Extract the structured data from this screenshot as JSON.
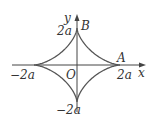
{
  "diagram": {
    "type": "astroid curve",
    "equation_hint": "x^(2/3) + y^(2/3) = (2a)^(2/3)",
    "axes": {
      "x_label": "x",
      "y_label": "y",
      "origin_label": "O"
    },
    "points": {
      "A": "A",
      "B": "B"
    },
    "ticks": {
      "x_pos": "2a",
      "x_neg": "−2a",
      "y_pos": "2a",
      "y_neg": "−2a"
    },
    "colors": {
      "curve": "#555555",
      "axis": "#333333"
    }
  }
}
